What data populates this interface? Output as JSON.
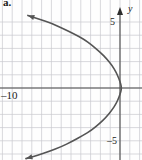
{
  "figure": {
    "part_label": "a.",
    "background_color": "#fefefe",
    "width": 142,
    "height": 160
  },
  "axes": {
    "x_axis_name": "x",
    "y_axis_name": "y",
    "axis_color": "#4a4a4a",
    "grid_color": "#c9c9cf",
    "curve_color": "#555555"
  },
  "labels": {
    "y_positive_5": "5",
    "y_negative_5": "–5",
    "x_negative_10": "–10"
  },
  "chart_data": {
    "type": "line",
    "title": "a.",
    "xlabel": "x",
    "ylabel": "y",
    "grid": true,
    "legend": "none",
    "orientation": "horizontal-parabola-opening-left",
    "xlim": [
      -12.2,
      2.2
    ],
    "ylim": [
      -6.0,
      5.6
    ],
    "xticks": [
      -10
    ],
    "yticks": [
      5,
      -5
    ],
    "xtick_labels": [
      "–10"
    ],
    "ytick_labels": [
      "5",
      "–5"
    ],
    "grid_step_x": 1,
    "grid_step_y": 1,
    "vertex": [
      0.2,
      0.0
    ],
    "equation_form": "x = a(y - k)^2 + h",
    "series": [
      {
        "name": "parabola",
        "arrows": [
          "start",
          "end"
        ],
        "points": [
          [
            -9.4,
            5.5
          ],
          [
            -8.2,
            5.2
          ],
          [
            -7.0,
            4.9
          ],
          [
            -5.8,
            4.5
          ],
          [
            -4.7,
            4.1
          ],
          [
            -3.7,
            3.7
          ],
          [
            -2.8,
            3.2
          ],
          [
            -2.0,
            2.7
          ],
          [
            -1.35,
            2.2
          ],
          [
            -0.8,
            1.7
          ],
          [
            -0.4,
            1.2
          ],
          [
            -0.1,
            0.7
          ],
          [
            0.1,
            0.25
          ],
          [
            0.15,
            0.0
          ],
          [
            0.1,
            -0.25
          ],
          [
            -0.1,
            -0.7
          ],
          [
            -0.4,
            -1.2
          ],
          [
            -0.85,
            -1.7
          ],
          [
            -1.4,
            -2.2
          ],
          [
            -2.1,
            -2.7
          ],
          [
            -2.9,
            -3.2
          ],
          [
            -3.8,
            -3.6
          ],
          [
            -4.9,
            -4.05
          ],
          [
            -6.0,
            -4.45
          ],
          [
            -7.2,
            -4.8
          ],
          [
            -8.4,
            -5.1
          ],
          [
            -9.6,
            -5.35
          ]
        ]
      }
    ]
  }
}
